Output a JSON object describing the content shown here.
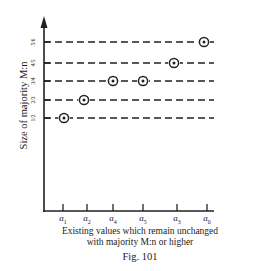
{
  "figure": {
    "caption": "Fig. 101",
    "y_axis_label": "Size of majority M:n",
    "x_axis_label_line1": "Existing values which  remain unchanged",
    "x_axis_label_line2": "with majority M:n or higher"
  },
  "y_levels": [
    {
      "label": "5/6",
      "y": 42
    },
    {
      "label": "4/5",
      "y": 63
    },
    {
      "label": "3/4",
      "y": 81
    },
    {
      "label": "2/3",
      "y": 100
    },
    {
      "label": "1/2",
      "y": 118
    }
  ],
  "x_ticks": [
    {
      "base": "a",
      "sub": "1",
      "x": 63
    },
    {
      "base": "a",
      "sub": "2",
      "x": 87
    },
    {
      "base": "a",
      "sub": "4",
      "x": 113
    },
    {
      "base": "a",
      "sub": "5",
      "x": 143
    },
    {
      "base": "a",
      "sub": "3",
      "x": 177
    },
    {
      "base": "a",
      "sub": "0",
      "x": 207
    }
  ],
  "points": [
    {
      "value": "a0",
      "level": 0,
      "x": 204,
      "y": 42
    },
    {
      "value": "a3",
      "level": 1,
      "x": 174,
      "y": 63
    },
    {
      "value": "a4",
      "level": 2,
      "x": 113,
      "y": 81
    },
    {
      "value": "a5",
      "level": 2,
      "x": 143,
      "y": 81
    },
    {
      "value": "a2",
      "level": 3,
      "x": 84,
      "y": 100
    },
    {
      "value": "a1",
      "level": 4,
      "x": 64,
      "y": 118
    }
  ]
}
